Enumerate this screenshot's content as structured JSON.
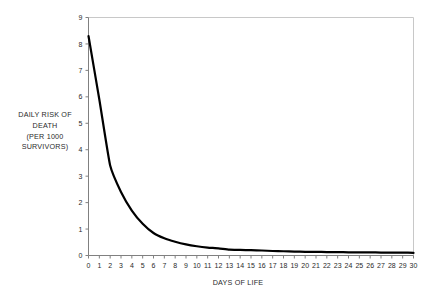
{
  "chart_data": {
    "type": "line",
    "title": "",
    "xlabel": "DAYS OF LIFE",
    "ylabel": "DAILY RISK OF DEATH (PER 1000 SURVIVORS)",
    "ylabel_lines": [
      "DAILY RISK OF",
      "DEATH",
      "(PER 1000",
      "SURVIVORS)"
    ],
    "xlim": [
      0,
      30
    ],
    "ylim": [
      0,
      9
    ],
    "xticks": [
      0,
      1,
      2,
      3,
      4,
      5,
      6,
      7,
      8,
      9,
      10,
      11,
      12,
      13,
      14,
      15,
      16,
      17,
      18,
      19,
      20,
      21,
      22,
      23,
      24,
      25,
      26,
      27,
      28,
      29,
      30
    ],
    "yticks": [
      0,
      1,
      2,
      3,
      4,
      5,
      6,
      7,
      8,
      9
    ],
    "grid": false,
    "legend": "none",
    "line_color": "#000000",
    "line_width": 2.2,
    "plot_border_color": "#c8c8c8",
    "axis_color": "#808080",
    "x": [
      0,
      1,
      2,
      3,
      4,
      5,
      6,
      7,
      8,
      9,
      10,
      11,
      12,
      13,
      14,
      15,
      16,
      17,
      18,
      19,
      20,
      21,
      22,
      23,
      24,
      25,
      26,
      27,
      28,
      29,
      30
    ],
    "values": [
      8.3,
      5.9,
      3.4,
      2.4,
      1.7,
      1.2,
      0.85,
      0.65,
      0.52,
      0.42,
      0.35,
      0.3,
      0.27,
      0.22,
      0.21,
      0.2,
      0.19,
      0.17,
      0.16,
      0.15,
      0.14,
      0.14,
      0.13,
      0.13,
      0.12,
      0.12,
      0.12,
      0.11,
      0.11,
      0.11,
      0.1
    ],
    "series": [
      {
        "name": "Daily risk of death per 1000 survivors",
        "values": [
          8.3,
          5.9,
          3.4,
          2.4,
          1.7,
          1.2,
          0.85,
          0.65,
          0.52,
          0.42,
          0.35,
          0.3,
          0.27,
          0.22,
          0.21,
          0.2,
          0.19,
          0.17,
          0.16,
          0.15,
          0.14,
          0.14,
          0.13,
          0.13,
          0.12,
          0.12,
          0.12,
          0.11,
          0.11,
          0.11,
          0.1
        ]
      }
    ]
  }
}
